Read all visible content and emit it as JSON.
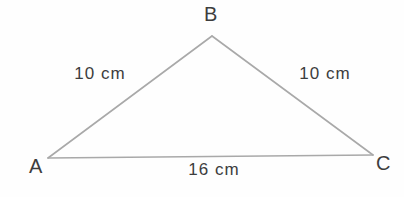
{
  "diagram": {
    "type": "triangle",
    "line_color": "#a9a9a9",
    "text_color": "#3d3d3d",
    "vertices": {
      "top": "B",
      "bottom_left": "A",
      "bottom_right": "C"
    },
    "sides": {
      "left": "10 cm",
      "right": "10 cm",
      "bottom": "16 cm"
    }
  }
}
